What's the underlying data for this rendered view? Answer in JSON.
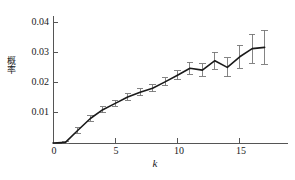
{
  "chart_data": {
    "type": "line",
    "title": "",
    "subtitle": "",
    "xlabel": "k",
    "ylabel": "概率",
    "xlim": [
      0,
      18
    ],
    "ylim": [
      0,
      0.044
    ],
    "xticks": [
      0,
      5,
      10,
      15
    ],
    "xtick_labels": [
      "0",
      "5",
      "10",
      "15"
    ],
    "yticks": [
      0.01,
      0.02,
      0.03,
      0.04
    ],
    "ytick_labels": [
      "0.01",
      "0.02",
      "0.03",
      "0.04"
    ],
    "grid": false,
    "legend": null,
    "line_color": "#1a1a1a",
    "errorbar_color": "#777777",
    "axis_color": "#555555",
    "x": [
      1,
      2,
      3,
      4,
      5,
      6,
      7,
      8,
      9,
      10,
      11,
      12,
      13,
      14,
      15,
      16,
      17
    ],
    "y": [
      0.0002,
      0.0042,
      0.0081,
      0.011,
      0.0131,
      0.0152,
      0.0168,
      0.0181,
      0.0202,
      0.0224,
      0.0247,
      0.0241,
      0.0272,
      0.025,
      0.0285,
      0.0312,
      0.0316
    ],
    "yerr": [
      0.0004,
      0.0009,
      0.0009,
      0.001,
      0.001,
      0.001,
      0.0011,
      0.0012,
      0.0013,
      0.0015,
      0.002,
      0.0021,
      0.0028,
      0.0031,
      0.0038,
      0.0048,
      0.0056
    ],
    "series": [
      {
        "name": "probability",
        "values": [
          0.0002,
          0.0042,
          0.0081,
          0.011,
          0.0131,
          0.0152,
          0.0168,
          0.0181,
          0.0202,
          0.0224,
          0.0247,
          0.0241,
          0.0272,
          0.025,
          0.0285,
          0.0312,
          0.0316
        ],
        "errors": [
          0.0004,
          0.0009,
          0.0009,
          0.001,
          0.001,
          0.001,
          0.0011,
          0.0012,
          0.0013,
          0.0015,
          0.002,
          0.0021,
          0.0028,
          0.0031,
          0.0038,
          0.0048,
          0.0056
        ]
      }
    ]
  }
}
